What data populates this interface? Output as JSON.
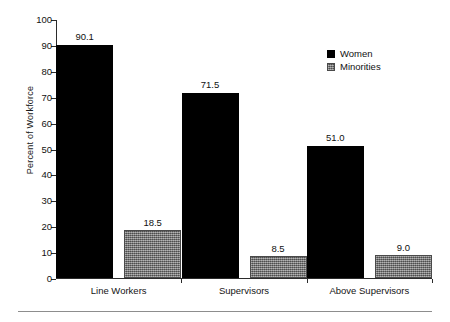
{
  "chart_data": {
    "type": "bar",
    "title": "",
    "subtitle": "",
    "xlabel": "",
    "ylabel": "Percent of Workforce",
    "categories": [
      "Line Workers",
      "Supervisors",
      "Above Supervisors"
    ],
    "series": [
      {
        "name": "Women",
        "color": "#000000",
        "values": [
          90.1,
          71.5,
          51.0
        ],
        "value_labels": [
          "90.1",
          "71.5",
          "51.0"
        ]
      },
      {
        "name": "Minorities",
        "color": "#7a7a7a",
        "values": [
          18.5,
          8.5,
          9.0
        ],
        "value_labels": [
          "18.5",
          "8.5",
          "9.0"
        ]
      }
    ],
    "ylim": [
      0,
      100
    ],
    "yticks": [
      0,
      10,
      20,
      30,
      40,
      50,
      60,
      70,
      80,
      90,
      100
    ],
    "ytick_labels": [
      "0",
      "10",
      "20",
      "30",
      "40",
      "50",
      "60",
      "70",
      "80",
      "90",
      "100"
    ],
    "grid": false,
    "legend_position": "upper right",
    "legend_entries": [
      "Women",
      "Minorities"
    ]
  },
  "axes": {
    "y_title": "Percent of Workforce"
  },
  "legend": {
    "items": [
      {
        "label": "Women",
        "swatch": "black-square-icon"
      },
      {
        "label": "Minorities",
        "swatch": "gray-square-icon"
      }
    ]
  }
}
